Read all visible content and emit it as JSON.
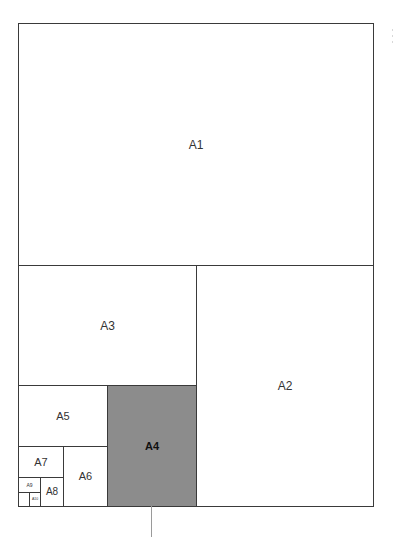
{
  "diagram": {
    "title": "",
    "highlight_color": "#8c8c8c",
    "line_color": "#3a3a3a",
    "sheets": [
      {
        "id": "A1",
        "label": "A1",
        "highlighted": false
      },
      {
        "id": "A2",
        "label": "A2",
        "highlighted": false
      },
      {
        "id": "A3",
        "label": "A3",
        "highlighted": false
      },
      {
        "id": "A4",
        "label": "A4",
        "highlighted": true
      },
      {
        "id": "A5",
        "label": "A5",
        "highlighted": false
      },
      {
        "id": "A6",
        "label": "A6",
        "highlighted": false
      },
      {
        "id": "A7",
        "label": "A7",
        "highlighted": false
      },
      {
        "id": "A8",
        "label": "A8",
        "highlighted": false
      },
      {
        "id": "A9",
        "label": "A9",
        "highlighted": false
      },
      {
        "id": "A10",
        "label": "A10",
        "highlighted": false
      }
    ]
  }
}
